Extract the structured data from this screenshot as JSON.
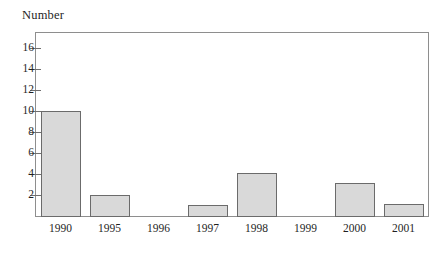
{
  "chart_data": {
    "type": "bar",
    "title": "",
    "subtitle": "",
    "xlabel": "",
    "ylabel": "Number",
    "categories": [
      "1990",
      "1995",
      "1996",
      "1997",
      "1998",
      "1999",
      "2000",
      "2001"
    ],
    "values": [
      10.1,
      2.1,
      0,
      1.1,
      4.2,
      0,
      3.2,
      1.2
    ],
    "series": [
      {
        "name": "Number",
        "values": [
          10.1,
          2.1,
          0,
          1.1,
          4.2,
          0,
          3.2,
          1.2
        ]
      }
    ],
    "ylim": [
      0,
      17.5
    ],
    "yticks": [
      2,
      4,
      6,
      8,
      10,
      12,
      14,
      16
    ],
    "ytick_labels": [
      "2",
      "4",
      "6",
      "8",
      "10",
      "12",
      "14",
      "16"
    ],
    "grid": false,
    "legend": false,
    "legend_position": "none",
    "bar_fill_color": "#d9d9d9",
    "bar_border_color": "#6b6b6b",
    "axis_color": "#8e8e8e",
    "background_color": "#ffffff",
    "text_color": "#1f1f1f"
  }
}
